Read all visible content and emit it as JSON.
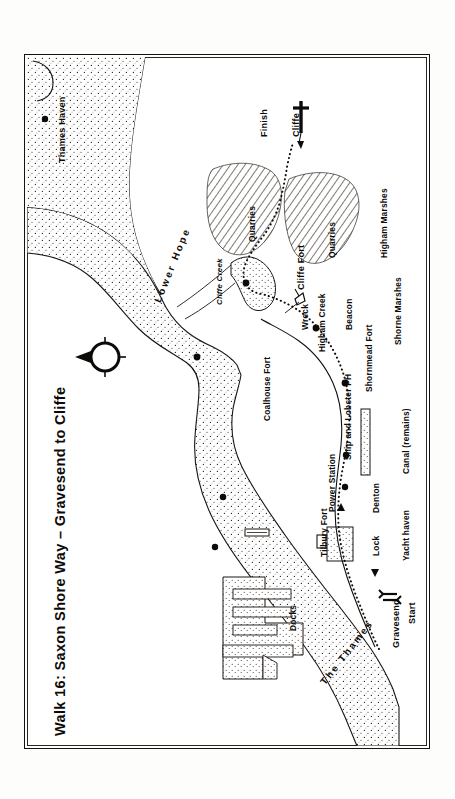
{
  "document": {
    "type": "walking-route-map",
    "title": "Walk 16: Saxon Shore Way – Gravesend to Cliffe",
    "orientation": "rotated-90-counterclockwise",
    "frame": "double-rule rectangular border"
  },
  "map": {
    "water_body_primary": "The Thames",
    "water_body_secondary": "Lower Hope",
    "creeks": [
      "Cliffe Creek",
      "Higham Creek"
    ],
    "compass": {
      "name": "north-arrow",
      "points_to": "north",
      "style": "circle with tick marks and filled arrow head"
    },
    "route": {
      "style": "dotted line",
      "start_label": "Start",
      "start_place": "Gravesend",
      "finish_label": "Finish",
      "finish_place": "Cliffe"
    },
    "labels": {
      "thames_haven": "Thames Haven",
      "lower_hope": "Lower Hope",
      "cliffe_creek": "Cliffe Creek",
      "coalhouse_fort": "Coalhouse Fort",
      "cliffe_fort": "Cliffe Fort",
      "quarries_west": "Quarries",
      "quarries_east": "Quarries",
      "finish": "Finish",
      "cliffe": "Cliffe",
      "higham_marshes": "Higham Marshes",
      "beacon": "Beacon",
      "wreck": "Wreck",
      "higham_creek": "Higham Creek",
      "shornmead_fort": "Shornmead Fort",
      "shorne_marshes": "Shorne Marshes",
      "ship_and_lobster_ph": "Ship and Lobster PH",
      "power_station": "Power Station",
      "tilbury_fort": "Tilbury Fort",
      "denton": "Denton",
      "lock": "Lock",
      "canal_remains": "Canal (remains)",
      "yacht_haven": "Yacht haven",
      "gravesend": "Gravesend",
      "start": "Start",
      "docks": "Docks",
      "the_thames": "The Thames"
    },
    "markers": [
      {
        "name": "thames-haven-marker",
        "label": "Thames Haven",
        "type": "dot"
      },
      {
        "name": "coalhouse-fort-marker",
        "label": "Coalhouse Fort",
        "type": "dot"
      },
      {
        "name": "cliffe-fort-marker",
        "label": "Cliffe Fort",
        "type": "dot"
      },
      {
        "name": "beacon-marker",
        "label": "Beacon",
        "type": "dot"
      },
      {
        "name": "shornmead-fort-marker",
        "label": "Shornmead Fort",
        "type": "dot"
      },
      {
        "name": "ship-and-lobster-marker",
        "label": "Ship and Lobster PH",
        "type": "dot"
      },
      {
        "name": "denton-marker",
        "label": "Denton",
        "type": "dot"
      },
      {
        "name": "power-station-marker",
        "label": "Power Station",
        "type": "dot"
      },
      {
        "name": "tilbury-fort-marker",
        "label": "Tilbury Fort",
        "type": "dot"
      },
      {
        "name": "wreck-marker",
        "label": "Wreck",
        "type": "wreck-symbol"
      },
      {
        "name": "cliffe-church-marker",
        "label": "Cliffe",
        "type": "cross-symbol"
      },
      {
        "name": "gravesend-station-marker",
        "label": "Gravesend",
        "type": "railway-station-symbol"
      }
    ],
    "areas": [
      {
        "name": "quarries-west",
        "label": "Quarries",
        "fill": "diagonal-hatch"
      },
      {
        "name": "quarries-east",
        "label": "Quarries",
        "fill": "diagonal-hatch"
      },
      {
        "name": "tilbury-docks",
        "label": "Docks",
        "fill": "stipple"
      },
      {
        "name": "canal-remains",
        "label": "Canal (remains)",
        "fill": "stipple"
      },
      {
        "name": "yacht-haven",
        "label": "Yacht haven",
        "fill": "stipple"
      }
    ],
    "colors": {
      "ink": "#0d0b09",
      "water_stipple": "#2a2520",
      "paper": "#ffffff",
      "hatch": "#30291f"
    }
  }
}
